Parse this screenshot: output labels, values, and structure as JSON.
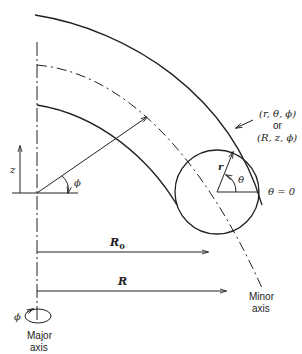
{
  "diagram": {
    "type": "toroidal-coordinate-system",
    "labels": {
      "z_axis": "z",
      "phi_angle": "ϕ",
      "coord_set_1": "(r, θ, ϕ)",
      "coord_or": "or",
      "coord_set_2": "(R, z, ϕ)",
      "minor_radius": "r",
      "theta_angle": "θ",
      "theta_zero": "θ = 0",
      "major_radius_R0": "R",
      "major_radius_R0_sub": "0",
      "major_radius_R": "R",
      "major_axis_phi": "ϕ",
      "major_axis_line1": "Major",
      "major_axis_line2": "axis",
      "minor_axis_line1": "Minor",
      "minor_axis_line2": "axis"
    },
    "colors": {
      "line": "#222222",
      "background": "#ffffff"
    }
  }
}
